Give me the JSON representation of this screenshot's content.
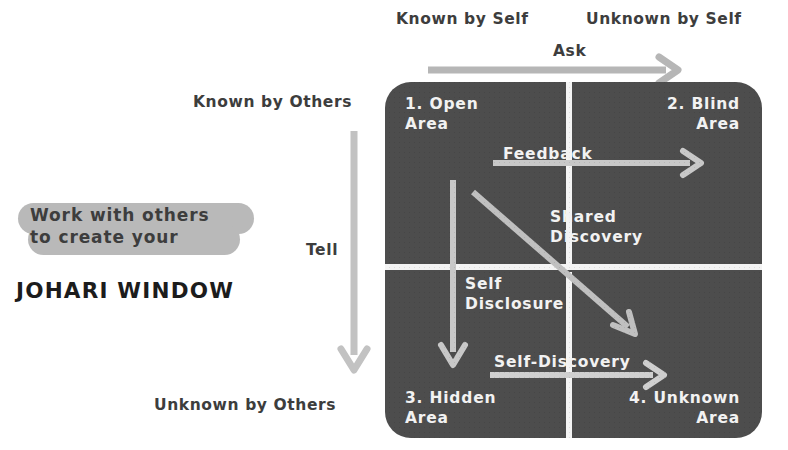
{
  "title_block": {
    "highlight_line_1": "Work with others",
    "highlight_line_2": "to create your",
    "main_title": "JOHARI WINDOW",
    "highlight_color": "#b9b9b9"
  },
  "axis_labels": {
    "top_left": "Known by Self",
    "top_right": "Unknown by Self",
    "left_top": "Known by Others",
    "left_bottom": "Unknown by Others"
  },
  "outer_arrows": [
    {
      "name": "ask",
      "label": "Ask",
      "direction": "right"
    },
    {
      "name": "tell",
      "label": "Tell",
      "direction": "down"
    }
  ],
  "quadrants": [
    {
      "id": "open",
      "label": "1. Open\nArea"
    },
    {
      "id": "blind",
      "label": "2. Blind\nArea"
    },
    {
      "id": "hidden",
      "label": "3. Hidden\nArea"
    },
    {
      "id": "unknown",
      "label": "4. Unknown\nArea"
    }
  ],
  "inner_arrows": [
    {
      "name": "feedback",
      "label": "Feedback",
      "direction": "right"
    },
    {
      "name": "self-disclosure",
      "label": "Self\nDisclosure",
      "direction": "down"
    },
    {
      "name": "shared-discovery",
      "label": "Shared\nDiscovery",
      "direction": "diagonal-down-right"
    },
    {
      "name": "self-discovery",
      "label": "Self-Discovery",
      "direction": "right"
    }
  ],
  "colors": {
    "matrix_background": "#4d4d4d",
    "divider": "#f4f4f4",
    "text_dark": "#3d3d3d",
    "text_light": "#f2f2f2",
    "arrow_gray": "#b0b0b0",
    "arrow_light": "#d6d6d6"
  }
}
